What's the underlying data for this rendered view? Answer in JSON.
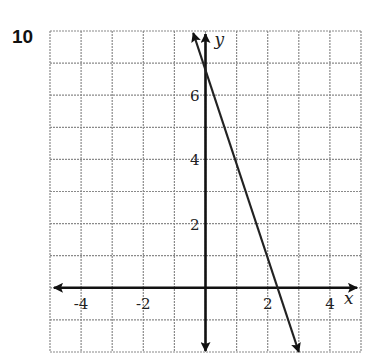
{
  "problem": {
    "number": "10"
  },
  "chart_data": {
    "type": "line",
    "title": "",
    "xlabel": "x",
    "ylabel": "y",
    "xlim": [
      -5,
      5
    ],
    "ylim": [
      -2,
      8
    ],
    "grid": true,
    "x_tick_labels": [
      "-4",
      "-2",
      "2",
      "4"
    ],
    "x_ticks": [
      -4,
      -2,
      2,
      4
    ],
    "y_tick_labels": [
      "2",
      "4",
      "6"
    ],
    "y_ticks": [
      2,
      4,
      6
    ],
    "series": [
      {
        "name": "line",
        "equation": "y = -3x + 7",
        "slope": -3,
        "intercept": 7,
        "x": [
          -0.33,
          0,
          1,
          2,
          2.33,
          3
        ],
        "y": [
          8,
          7,
          4,
          1,
          0,
          -2
        ],
        "arrows": "both ends"
      }
    ],
    "legend": null
  },
  "colors": {
    "grid": "#8a8a8a",
    "axis": "#111111",
    "line": "#222222"
  }
}
